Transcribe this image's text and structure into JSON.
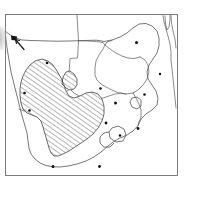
{
  "figure": {
    "background_color": "#ffffff",
    "frame": {
      "name": "map-frame",
      "stroke_color": "#6e6e6e",
      "x": 5,
      "y": 14,
      "width": 173,
      "height": 162
    }
  },
  "style": {
    "coastline_color": "#4a4a4a",
    "border_color": "#5a5a5a",
    "range_outline_color": "#3a3a3a",
    "hatch_color": "#555555",
    "hatch_angle_deg": 45,
    "hatch_spacing_px": 4,
    "locality_dot_color": "#111111",
    "smudge_color": "#6a6a6a"
  },
  "layers": [
    {
      "name": "coastline-layer",
      "label": "Coastline"
    },
    {
      "name": "national-borders-layer",
      "label": "National borders"
    },
    {
      "name": "distribution-range-layer",
      "label": "Distribution range (hatched)"
    },
    {
      "name": "locality-points-layer",
      "label": "Point localities"
    }
  ],
  "distribution_range": {
    "name": "hatched-range-polygon",
    "fill_pattern": "diagonal-hatch",
    "label": "Hatched distribution area"
  },
  "locality_points": [
    {
      "id": 1,
      "name": "locality-dot-1",
      "x": 136.5,
      "y": 42.5,
      "r": 1.5
    },
    {
      "id": 2,
      "name": "locality-dot-2",
      "x": 100.5,
      "y": 88.5,
      "r": 1.3
    },
    {
      "id": 3,
      "name": "locality-dot-3",
      "x": 115.5,
      "y": 103.0,
      "r": 1.5
    },
    {
      "id": 4,
      "name": "locality-dot-4",
      "x": 106.0,
      "y": 123.0,
      "r": 1.4
    },
    {
      "id": 5,
      "name": "locality-dot-5",
      "x": 138.0,
      "y": 128.5,
      "r": 1.4
    },
    {
      "id": 6,
      "name": "locality-dot-6",
      "x": 120.0,
      "y": 135.5,
      "r": 1.3
    },
    {
      "id": 7,
      "name": "locality-dot-7",
      "x": 99.5,
      "y": 166.5,
      "r": 1.4
    },
    {
      "id": 8,
      "name": "locality-dot-8",
      "x": 53.0,
      "y": 166.5,
      "r": 1.5
    },
    {
      "id": 9,
      "name": "locality-dot-9",
      "x": 29.5,
      "y": 110.5,
      "r": 1.3
    },
    {
      "id": 10,
      "name": "locality-dot-10",
      "x": 24.5,
      "y": 93.0,
      "r": 1.3
    },
    {
      "id": 11,
      "name": "locality-dot-11",
      "x": 47.0,
      "y": 63.0,
      "r": 1.3
    },
    {
      "id": 12,
      "name": "locality-dot-12",
      "x": 144.5,
      "y": 94.5,
      "r": 1.3
    },
    {
      "id": 13,
      "name": "locality-dot-13",
      "x": 160.0,
      "y": 74.0,
      "r": 1.2
    },
    {
      "id": 14,
      "name": "locality-dot-14",
      "x": 13.5,
      "y": 38.0,
      "r": 2.2
    }
  ],
  "annotations": {
    "edge_smudge": {
      "name": "scan-edge-smudge",
      "label": "Dark scan artifact at left edge"
    },
    "arrow_mark": {
      "name": "pen-arrow-mark",
      "label": "Hand-drawn pointer mark near north-west coast"
    }
  }
}
